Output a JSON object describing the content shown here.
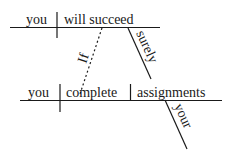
{
  "diagram": {
    "type": "sentence-diagram",
    "main_clause": {
      "subject": "you",
      "verb": "will succeed",
      "modifier": "surely"
    },
    "subordinate_clause": {
      "conjunction": "If",
      "subject": "you",
      "verb": "complete",
      "object": "assignments",
      "object_modifier": "your"
    }
  }
}
